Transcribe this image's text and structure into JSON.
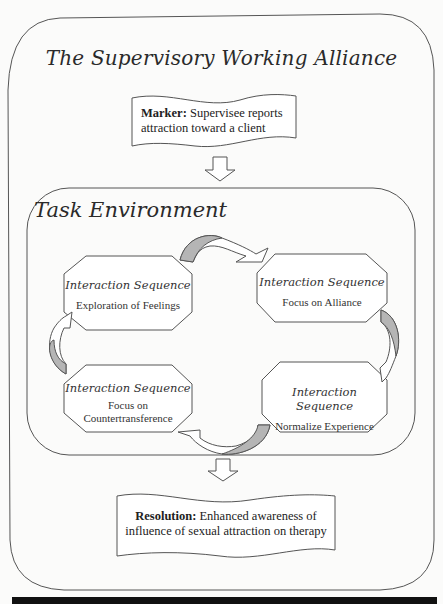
{
  "diagram": {
    "title": "The Supervisory Working Alliance",
    "marker": {
      "label": "Marker:",
      "text_line1": "Supervisee reports",
      "text_line2": "attraction toward a client"
    },
    "task_environment": {
      "title": "Task Environment",
      "sequences": [
        {
          "heading": "Interaction Sequence",
          "line1": "Exploration of Feelings",
          "line2": ""
        },
        {
          "heading": "Interaction Sequence",
          "line1": "Focus on Alliance",
          "line2": ""
        },
        {
          "heading": "Interaction Sequence",
          "line1": "Normalize Experience",
          "line2": ""
        },
        {
          "heading": "Interaction Sequence",
          "line1": "Focus on",
          "line2": "Countertransference"
        }
      ]
    },
    "resolution": {
      "label": "Resolution:",
      "text_line1": "Enhanced awareness of",
      "text_line2": "influence of sexual attraction on therapy"
    },
    "colors": {
      "stroke": "#555555",
      "arrow_fill": "#b5b5b5",
      "background": "#fbfbfa",
      "bottom_bar": "#111111"
    }
  }
}
